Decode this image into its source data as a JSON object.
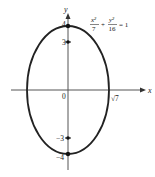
{
  "figure": {
    "type": "ellipse-graph",
    "equation": {
      "x_term_num": "x²",
      "x_term_den": "7",
      "plus": "+",
      "y_term_num": "y²",
      "y_term_den": "16",
      "rhs": "= 1"
    },
    "axes": {
      "x_label": "x",
      "y_label": "y",
      "origin_label": "0"
    },
    "ticks": {
      "y_pos4": "4",
      "y_pos3": "3",
      "y_neg3": "−3",
      "y_neg4": "−4",
      "x_sqrt7": "√7"
    },
    "ellipse": {
      "semi_major_y": 4,
      "semi_minor_x": "√7",
      "foci": [
        "(0, 3)",
        "(0, −3)"
      ],
      "vertices": [
        "(0, 4)",
        "(0, −4)"
      ]
    },
    "colors": {
      "stroke": "#222222",
      "axis": "#555555",
      "background": "#ffffff"
    }
  }
}
